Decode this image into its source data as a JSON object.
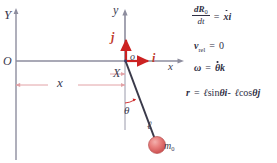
{
  "figure": {
    "background": "#ffffff"
  },
  "colors": {
    "axis_gray": "#8d8d9e",
    "vector_red": "#cc2222",
    "dimension_pink": "#e2a2a6",
    "rod_dark": "#3a3a4a",
    "bob_red": "#e06a6a",
    "text_dark": "#3b3b4f"
  },
  "diagram": {
    "fixed_frame": {
      "y_axis_label": "Y",
      "origin_label": "O"
    },
    "moving_frame": {
      "y_axis_label": "y",
      "x_axis_label": "x",
      "origin_label": "o",
      "unit_vector_x": "i",
      "unit_vector_y": "j"
    },
    "dimensions": {
      "horizontal_offset_label": "x",
      "point_label": "X"
    },
    "pendulum": {
      "angle_label": "θ",
      "rod_length_label": "ℓ",
      "bob_label": "m",
      "bob_subscript": "0"
    }
  },
  "equations": [
    {
      "id": "velocity-of-origin",
      "lhs_numerator": "dR",
      "lhs_numerator_sub": "0",
      "lhs_denominator": "dt",
      "relation": "=",
      "rhs": "ẋi",
      "rhs_symbol": "x",
      "rhs_vector": "i"
    },
    {
      "id": "relative-velocity",
      "lhs": "v",
      "lhs_sub": "rel",
      "relation": "=",
      "rhs": "0"
    },
    {
      "id": "angular-velocity",
      "lhs": "ω",
      "relation": "=",
      "rhs_symbol": "θ",
      "rhs_vector": "k",
      "rhs": "θ̇k"
    },
    {
      "id": "position-vector",
      "lhs": "r",
      "relation": "=",
      "term1_len": "ℓ",
      "term1_trig": "sin",
      "term1_angle": "θ",
      "term1_vector": "i",
      "operator": "-",
      "term2_len": "ℓ",
      "term2_trig": "cos",
      "term2_angle": "θ",
      "term2_vector": "j",
      "rhs": "ℓ sin θ i - ℓ cos θ j"
    }
  ]
}
